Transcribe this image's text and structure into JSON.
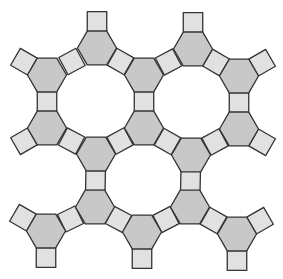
{
  "diagram": {
    "type": "tiling-fragment",
    "colors": {
      "background": "#ffffff",
      "hexagon_fill": "#c8c8c8",
      "square_fill": "#e1e1e1",
      "stroke": "#333333"
    },
    "hex_radius": 19.5,
    "square_side": 19.5,
    "hexagons": [
      [
        97,
        48
      ],
      [
        193,
        49
      ],
      [
        47,
        75
      ],
      [
        144,
        75
      ],
      [
        239,
        76
      ],
      [
        47,
        128
      ],
      [
        144,
        128
      ],
      [
        239,
        129
      ],
      [
        96,
        154
      ],
      [
        191,
        155
      ],
      [
        95,
        207
      ],
      [
        190,
        207
      ],
      [
        46,
        231
      ],
      [
        142,
        232
      ],
      [
        237,
        234
      ]
    ],
    "links": [
      [
        0,
        2
      ],
      [
        0,
        3
      ],
      [
        1,
        3
      ],
      [
        1,
        4
      ],
      [
        2,
        5
      ],
      [
        3,
        6
      ],
      [
        4,
        7
      ],
      [
        5,
        8
      ],
      [
        6,
        8
      ],
      [
        6,
        9
      ],
      [
        7,
        9
      ],
      [
        8,
        10
      ],
      [
        9,
        11
      ],
      [
        10,
        12
      ],
      [
        10,
        13
      ],
      [
        11,
        13
      ],
      [
        11,
        14
      ]
    ],
    "outer_squares": [
      [
        0,
        90
      ],
      [
        1,
        90
      ],
      [
        2,
        150
      ],
      [
        4,
        30
      ],
      [
        5,
        210
      ],
      [
        7,
        330
      ],
      [
        12,
        150
      ],
      [
        12,
        270
      ],
      [
        13,
        270
      ],
      [
        14,
        30
      ],
      [
        14,
        270
      ]
    ]
  }
}
